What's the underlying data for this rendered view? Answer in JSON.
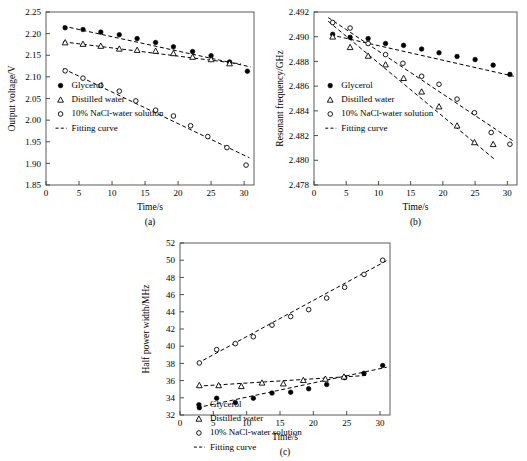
{
  "figure": {
    "panels": [
      "(a)",
      "(b)",
      "(c)"
    ],
    "series_names": [
      "Glycerol",
      "Distilled water",
      "10% NaCl-water solution",
      "Fitting curve"
    ]
  },
  "chart_data": [
    {
      "type": "scatter",
      "panel": "(a)",
      "title": "",
      "xlabel": "Time/s",
      "ylabel": "Output voltage/V",
      "xlim": [
        0,
        31.5
      ],
      "ylim": [
        1.85,
        2.25
      ],
      "xticks": [
        0,
        5,
        10,
        15,
        20,
        25,
        30
      ],
      "yticks": [
        1.85,
        1.9,
        1.95,
        2.0,
        2.05,
        2.1,
        2.15,
        2.2,
        2.25
      ],
      "ytick_labels": [
        "1.85",
        "1.90",
        "1.95",
        "2.00",
        "2.05",
        "2.10",
        "2.15",
        "2.20",
        "2.25"
      ],
      "grid": false,
      "legend_position": "lower-left",
      "legend": [
        "Glycerol",
        "Distilled water",
        "10% NaCl-water solution",
        "Fitting curve"
      ],
      "series": [
        {
          "name": "Glycerol",
          "marker": "filled-circle",
          "x": [
            2.9,
            5.6,
            8.3,
            11.1,
            13.8,
            16.6,
            19.3,
            22.2,
            25.0,
            27.8,
            30.5
          ],
          "y": [
            2.2135,
            2.2095,
            2.2035,
            2.1975,
            2.1885,
            2.1795,
            2.1695,
            2.1585,
            2.149,
            2.1345,
            2.113
          ],
          "fit_line": {
            "x": [
              2.6,
              31.0
            ],
            "y": [
              2.2175,
              2.123
            ]
          }
        },
        {
          "name": "Distilled water",
          "marker": "open-triangle",
          "x": [
            2.9,
            5.6,
            8.3,
            11.1,
            13.8,
            16.6,
            19.3,
            22.2,
            25.0,
            27.8
          ],
          "y": [
            2.1795,
            2.176,
            2.1715,
            2.165,
            2.162,
            2.16,
            2.1545,
            2.146,
            2.1405,
            2.131
          ],
          "fit_line": {
            "x": [
              2.6,
              29.5
            ],
            "y": [
              2.181,
              2.13
            ]
          }
        },
        {
          "name": "10% NaCl-water solution",
          "marker": "open-circle",
          "x": [
            2.9,
            5.6,
            8.3,
            11.1,
            13.6,
            16.6,
            19.3,
            21.9,
            24.5,
            27.4,
            30.3
          ],
          "y": [
            2.114,
            2.097,
            2.08,
            2.067,
            2.0445,
            2.023,
            2.0095,
            1.987,
            1.962,
            1.9365,
            1.896
          ],
          "fit_line": {
            "x": [
              2.6,
              30.8
            ],
            "y": [
              2.119,
              1.913
            ]
          }
        }
      ]
    },
    {
      "type": "scatter",
      "panel": "(b)",
      "title": "",
      "xlabel": "Time/s",
      "ylabel": "Resonant frequency/GHz",
      "xlim": [
        0,
        31.5
      ],
      "ylim": [
        2.478,
        2.492
      ],
      "xticks": [
        0,
        5,
        10,
        15,
        20,
        25,
        30
      ],
      "yticks": [
        2.478,
        2.48,
        2.482,
        2.484,
        2.486,
        2.488,
        2.49,
        2.492
      ],
      "ytick_labels": [
        "2.478",
        "2.480",
        "2.482",
        "2.484",
        "2.486",
        "2.488",
        "2.490",
        "2.492"
      ],
      "grid": false,
      "legend_position": "lower-left",
      "legend": [
        "Glycerol",
        "Distilled water",
        "10% NaCl-water solution",
        "Fitting curve"
      ],
      "series": [
        {
          "name": "Glycerol",
          "marker": "filled-circle",
          "x": [
            2.9,
            5.6,
            8.4,
            11.1,
            13.9,
            16.7,
            19.4,
            22.2,
            25.0,
            27.8,
            30.4
          ],
          "y": [
            2.4902,
            2.48995,
            2.48985,
            2.48945,
            2.4893,
            2.489,
            2.4887,
            2.4884,
            2.48815,
            2.4877,
            2.48695
          ],
          "fit_line": {
            "x": [
              2.6,
              31.0
            ],
            "y": [
              2.49015,
              2.4868
            ]
          }
        },
        {
          "name": "Distilled water",
          "marker": "open-triangle",
          "x": [
            2.9,
            5.6,
            8.4,
            11.1,
            13.9,
            16.7,
            19.4,
            22.2,
            24.9,
            27.8
          ],
          "y": [
            2.49,
            2.48915,
            2.48845,
            2.48775,
            2.48665,
            2.48555,
            2.48435,
            2.4828,
            2.48145,
            2.4813
          ],
          "fit_line": {
            "x": [
              2.2,
              28.2
            ],
            "y": [
              2.49125,
              2.48
            ]
          }
        },
        {
          "name": "10% NaCl-water solution",
          "marker": "open-circle",
          "x": [
            2.9,
            5.6,
            8.4,
            11.1,
            13.8,
            16.7,
            19.4,
            22.2,
            24.9,
            27.5,
            30.4
          ],
          "y": [
            2.49115,
            2.4907,
            2.48945,
            2.48855,
            2.48785,
            2.4868,
            2.48615,
            2.48495,
            2.48385,
            2.48225,
            2.4813
          ],
          "fit_line": {
            "x": [
              2.2,
              30.8
            ],
            "y": [
              2.49155,
              2.4816
            ]
          }
        }
      ]
    },
    {
      "type": "scatter",
      "panel": "(c)",
      "title": "",
      "xlabel": "Time/s",
      "ylabel": "Half power width/MHz",
      "xlim": [
        0,
        31.5
      ],
      "ylim": [
        32,
        52
      ],
      "xticks": [
        0,
        5,
        10,
        15,
        20,
        25,
        30
      ],
      "yticks": [
        32,
        34,
        36,
        38,
        40,
        42,
        44,
        46,
        48,
        50,
        52
      ],
      "ytick_labels": [
        "32",
        "34",
        "36",
        "38",
        "40",
        "42",
        "44",
        "46",
        "48",
        "50",
        "52"
      ],
      "grid": false,
      "legend_position": "upper-left",
      "legend": [
        "Glycerol",
        "Distilled water",
        "10% NaCl-water solution",
        "Fitting curve"
      ],
      "series": [
        {
          "name": "Glycerol",
          "marker": "filled-circle",
          "x": [
            2.9,
            5.5,
            8.3,
            11.0,
            13.8,
            16.6,
            19.3,
            22.0,
            24.7,
            27.6,
            30.4
          ],
          "y": [
            32.85,
            33.95,
            33.45,
            33.95,
            34.55,
            34.65,
            35.05,
            35.55,
            36.35,
            36.85,
            37.75
          ],
          "fit_line": {
            "x": [
              2.6,
              31.0
            ],
            "y": [
              32.85,
              37.55
            ]
          }
        },
        {
          "name": "Distilled water",
          "marker": "open-triangle",
          "x": [
            2.9,
            5.8,
            9.2,
            12.3,
            15.5,
            18.5,
            21.8,
            24.6
          ],
          "y": [
            35.45,
            35.45,
            35.35,
            35.75,
            35.65,
            36.05,
            36.2,
            36.45
          ],
          "fit_line": {
            "x": [
              2.6,
              28.0
            ],
            "y": [
              35.35,
              36.6
            ]
          }
        },
        {
          "name": "10% NaCl-water solution",
          "marker": "open-circle",
          "x": [
            2.9,
            5.5,
            8.3,
            11.0,
            13.8,
            16.6,
            19.3,
            22.0,
            24.7,
            27.6,
            30.4
          ],
          "y": [
            38.05,
            39.6,
            40.3,
            41.1,
            42.45,
            43.45,
            44.25,
            45.6,
            46.85,
            48.35,
            50.0
          ],
          "fit_line": {
            "x": [
              2.6,
              31.0
            ],
            "y": [
              38.0,
              49.95
            ]
          }
        }
      ]
    }
  ]
}
